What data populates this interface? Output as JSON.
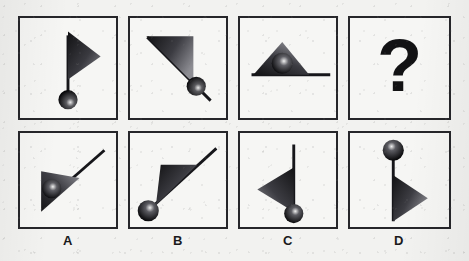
{
  "puzzle": {
    "type": "visual-analogy-rotation-sequence",
    "background_color": "#f2f2f0",
    "ink_color": "#26262a",
    "sequence": [
      {
        "id": "panel-1",
        "name": "sequence-panel-1",
        "description": "Vertical line with ball at bottom and right-pointing triangle at top",
        "rotation_deg": 0,
        "line": {
          "x1": 50,
          "y1": 18,
          "x2": 50,
          "y2": 78
        },
        "triangle": {
          "points": "50,14 50,64 84,40"
        },
        "ball": {
          "cx": 50,
          "cy": 84,
          "r": 10
        }
      },
      {
        "id": "panel-2",
        "name": "sequence-panel-2",
        "description": "Diagonal line from upper-left to lower-right, triangle at upper-left, ball near lower-right with line overshooting",
        "rotation_deg": 45,
        "line": {
          "x1": 20,
          "y1": 20,
          "x2": 84,
          "y2": 84
        },
        "triangle": {
          "points": "18,20 64,20 64,66"
        },
        "ball": {
          "cx": 70,
          "cy": 70,
          "r": 10
        }
      },
      {
        "id": "panel-3",
        "name": "sequence-panel-3",
        "description": "Horizontal line with triangle above its left portion and ball resting inside the triangle",
        "rotation_deg": 90,
        "line": {
          "x1": 14,
          "y1": 60,
          "x2": 96,
          "y2": 60
        },
        "triangle": {
          "points": "16,60 74,60 45,26"
        },
        "ball": {
          "cx": 45,
          "cy": 48,
          "r": 11
        }
      },
      {
        "id": "panel-4",
        "name": "sequence-panel-missing",
        "description": "Unknown — answer slot shown as a bold question mark",
        "glyph": "?"
      }
    ],
    "options": [
      {
        "id": "option-a",
        "label": "A",
        "name": "answer-option-a",
        "description": "Diagonal line lower-left to upper-right, triangle at lower-left, ball inside triangle",
        "line": {
          "x1": 26,
          "y1": 74,
          "x2": 88,
          "y2": 20
        },
        "triangle": {
          "points": "22,44 22,86 62,50"
        },
        "ball": {
          "cx": 34,
          "cy": 62,
          "r": 10
        }
      },
      {
        "id": "option-b",
        "label": "B",
        "name": "answer-option-b",
        "description": "Long diagonal line with ball at lower-left end and triangle along upper-left of the line",
        "line": {
          "x1": 22,
          "y1": 80,
          "x2": 90,
          "y2": 18
        },
        "triangle": {
          "points": "32,36 68,36 26,78"
        },
        "ball": {
          "cx": 20,
          "cy": 82,
          "r": 11
        }
      },
      {
        "id": "option-c",
        "label": "C",
        "name": "answer-option-c",
        "description": "Vertical line with ball at bottom and left-pointing triangle on the lower half",
        "line": {
          "x1": 56,
          "y1": 14,
          "x2": 56,
          "y2": 80
        },
        "triangle": {
          "points": "56,38 56,84 18,60"
        },
        "ball": {
          "cx": 56,
          "cy": 86,
          "r": 10
        }
      },
      {
        "id": "option-d",
        "label": "D",
        "name": "answer-option-d",
        "description": "Vertical line with ball at top and right-pointing triangle on the lower half",
        "line": {
          "x1": 46,
          "y1": 22,
          "x2": 46,
          "y2": 92
        },
        "triangle": {
          "points": "46,46 46,92 82,68"
        },
        "ball": {
          "cx": 46,
          "cy": 20,
          "r": 11
        }
      }
    ]
  }
}
